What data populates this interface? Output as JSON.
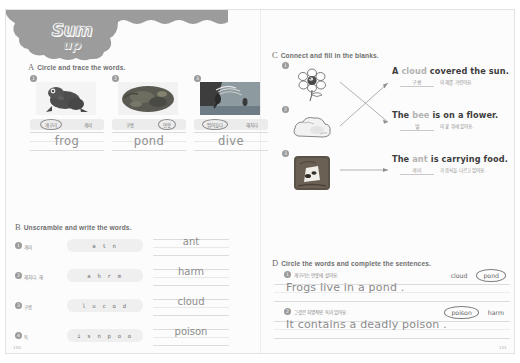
{
  "header": {
    "cropped_top_text": "",
    "logo_line1": "Sum",
    "logo_line2": "up"
  },
  "page": {
    "page_number_left": "100",
    "page_number_right": "101"
  },
  "sectionA": {
    "letter": "A",
    "title": "Circle and trace the words.",
    "items": [
      {
        "num": "1",
        "picture": "frog-photo",
        "chips": [
          {
            "label": "개구리",
            "circled": true
          },
          {
            "label": "개미",
            "circled": false
          }
        ],
        "trace_word": "frog"
      },
      {
        "num": "2",
        "picture": "pond-photo",
        "chips": [
          {
            "label": "구름",
            "circled": false
          },
          {
            "label": "연못",
            "circled": true
          }
        ],
        "trace_word": "pond"
      },
      {
        "num": "3",
        "picture": "dive-photo",
        "chips": [
          {
            "label": "뛰어들다",
            "circled": true
          },
          {
            "label": "해치다",
            "circled": false
          }
        ],
        "trace_word": "dive"
      }
    ]
  },
  "sectionB": {
    "letter": "B",
    "title": "Unscramble and write the words.",
    "rows": [
      {
        "num": "1",
        "korean": "개미",
        "scramble": "a t n",
        "answer": "ant"
      },
      {
        "num": "2",
        "korean": "해치다, 해",
        "scramble": "a h r m",
        "answer": "harm"
      },
      {
        "num": "3",
        "korean": "구름",
        "scramble": "l u c o d",
        "answer": "cloud"
      },
      {
        "num": "4",
        "korean": "독",
        "scramble": "i s n p o o",
        "answer": "poison"
      }
    ]
  },
  "sectionC": {
    "letter": "C",
    "title": "Connect and fill in the blanks.",
    "items": [
      {
        "num": "1",
        "picture": "flower-with-bee-drawing",
        "english_before": "A ",
        "english_blank": "cloud",
        "english_after": " covered the sun.",
        "korean_answer": "구름",
        "korean_tail": "이 해를 가렸어요."
      },
      {
        "num": "2",
        "picture": "cloud-drawing",
        "english_before": "The ",
        "english_blank": "bee",
        "english_after": " is on a flower.",
        "korean_answer": "벌",
        "korean_tail": "이 꽃 위에 있어요."
      },
      {
        "num": "3",
        "picture": "ant-photo",
        "english_before": "The ",
        "english_blank": "ant",
        "english_after": " is carrying food.",
        "korean_answer": "개미",
        "korean_tail": "가 음식을 나르고 있어요."
      }
    ]
  },
  "sectionD": {
    "letter": "D",
    "title": "Circle the words and complete the sentences.",
    "rows": [
      {
        "num": "1",
        "korean": "개구리는 연못에 살아요.",
        "choices": [
          {
            "label": "cloud",
            "circled": false
          },
          {
            "label": "pond",
            "circled": true
          }
        ],
        "sentence": "Frogs live in a  pond  ."
      },
      {
        "num": "2",
        "korean": "그것은 치명적인 독이 있어요.",
        "choices": [
          {
            "label": "poison",
            "circled": true
          },
          {
            "label": "harm",
            "circled": false
          }
        ],
        "sentence": "It contains a deadly  poison  ."
      }
    ]
  }
}
